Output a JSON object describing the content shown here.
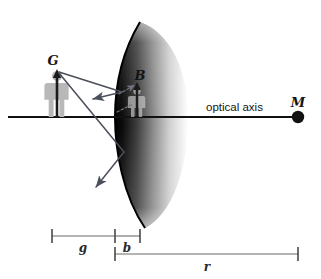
{
  "figure": {
    "type": "optics-ray-diagram",
    "background_color": "#ffffff"
  },
  "labels": {
    "object": "G",
    "image": "B",
    "center_of_curvature": "M",
    "axis": "optical axis"
  },
  "dimensions": {
    "object_distance": "g",
    "image_distance": "b",
    "radius": "r"
  },
  "colors": {
    "axis": "#111111",
    "ray": "#4a4f5a",
    "mirror_edge": "#000000",
    "person": "#b8b8b8",
    "dimension": "#6b6b6b"
  },
  "geometry": {
    "axis_y": 117,
    "axis_x_start": 8,
    "axis_x_end": 300,
    "mirror_vertex_x": 115,
    "object_x": 57,
    "image_x": 137,
    "center_x": 298,
    "object_tip_y": 71,
    "image_tip_y": 84
  }
}
